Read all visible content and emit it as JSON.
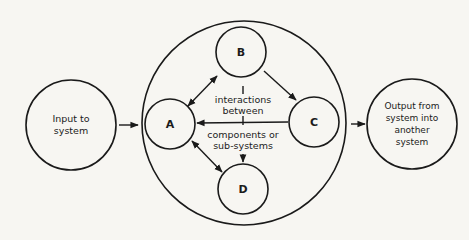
{
  "diagram": {
    "input_node": {
      "label": "Input to\nsystem"
    },
    "output_node": {
      "label": "Output from\nsystem into\nanother system"
    },
    "system_boundary": {
      "label": ""
    },
    "components": [
      {
        "id": "A",
        "label": "A"
      },
      {
        "id": "B",
        "label": "B"
      },
      {
        "id": "C",
        "label": "C"
      },
      {
        "id": "D",
        "label": "D"
      }
    ],
    "center_label_top": "interactions\nbetween",
    "center_label_bottom": "components or\nsub-systems",
    "edges": [
      {
        "from": "Input",
        "to": "System",
        "type": "arrow"
      },
      {
        "from": "System",
        "to": "Output",
        "type": "arrow"
      },
      {
        "from": "A",
        "to": "B",
        "type": "double-arrow"
      },
      {
        "from": "B",
        "to": "C",
        "type": "arrow"
      },
      {
        "from": "C",
        "to": "A",
        "type": "arrow"
      },
      {
        "from": "A",
        "to": "D",
        "type": "double-arrow"
      },
      {
        "from": "B",
        "to": "D",
        "type": "arrow",
        "via": "center label"
      }
    ],
    "colors": {
      "line": "#1a1a1a",
      "background": "#f7f6f2"
    }
  }
}
